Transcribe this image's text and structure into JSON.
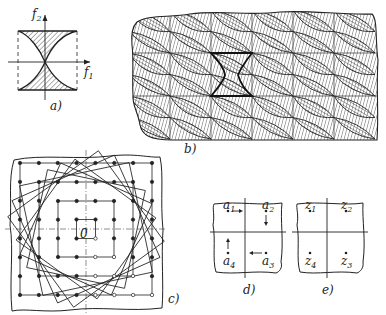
{
  "figure": {
    "panels": [
      {
        "id": "a",
        "label": "a)",
        "axis_x": "f",
        "axis_x_sub": "1",
        "axis_y": "f",
        "axis_y_sub": "2"
      },
      {
        "id": "b",
        "label": "b)"
      },
      {
        "id": "c",
        "label": "c)",
        "center_label": "0"
      },
      {
        "id": "d",
        "label": "d)",
        "points": [
          {
            "name": "a",
            "sub": "1"
          },
          {
            "name": "a",
            "sub": "2"
          },
          {
            "name": "a",
            "sub": "3"
          },
          {
            "name": "a",
            "sub": "4"
          }
        ]
      },
      {
        "id": "e",
        "label": "e)",
        "points": [
          {
            "name": "z",
            "sub": "1"
          },
          {
            "name": "z",
            "sub": "2"
          },
          {
            "name": "z",
            "sub": "3"
          },
          {
            "name": "z",
            "sub": "4"
          }
        ]
      }
    ],
    "colors": {
      "ink": "#222222",
      "background": "#ffffff"
    }
  }
}
